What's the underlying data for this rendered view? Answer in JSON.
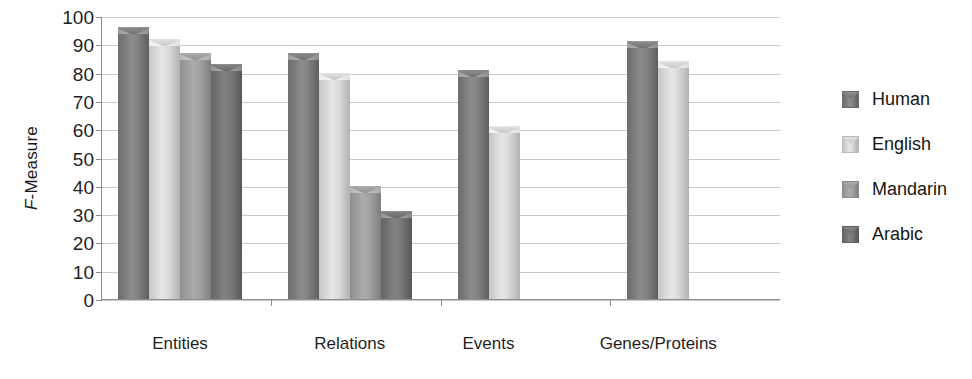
{
  "chart_data": {
    "type": "bar",
    "title": "",
    "xlabel": "",
    "ylabel": "F-Measure",
    "ylim": [
      0,
      100
    ],
    "ytick_step": 10,
    "yticks": [
      100,
      90,
      80,
      70,
      60,
      50,
      40,
      30,
      20,
      10,
      0
    ],
    "grid": true,
    "legend_position": "right",
    "categories": [
      "Entities",
      "Relations",
      "Events",
      "Genes/Proteins"
    ],
    "series": [
      {
        "name": "Human",
        "color": "#7a7a7a",
        "values": [
          96,
          87,
          81,
          91
        ]
      },
      {
        "name": "English",
        "color": "#d6d6d6",
        "values": [
          92,
          80,
          61,
          84
        ]
      },
      {
        "name": "Mandarin",
        "color": "#9e9e9e",
        "values": [
          87,
          40,
          null,
          null
        ]
      },
      {
        "name": "Arabic",
        "color": "#6e6e6e",
        "values": [
          83,
          31,
          null,
          null
        ]
      }
    ]
  },
  "axis": {
    "y_title_prefix": "F",
    "y_title_rest": "-Measure"
  },
  "legend": {
    "items": [
      {
        "label": "Human"
      },
      {
        "label": "English"
      },
      {
        "label": "Mandarin"
      },
      {
        "label": "Arabic"
      }
    ]
  }
}
